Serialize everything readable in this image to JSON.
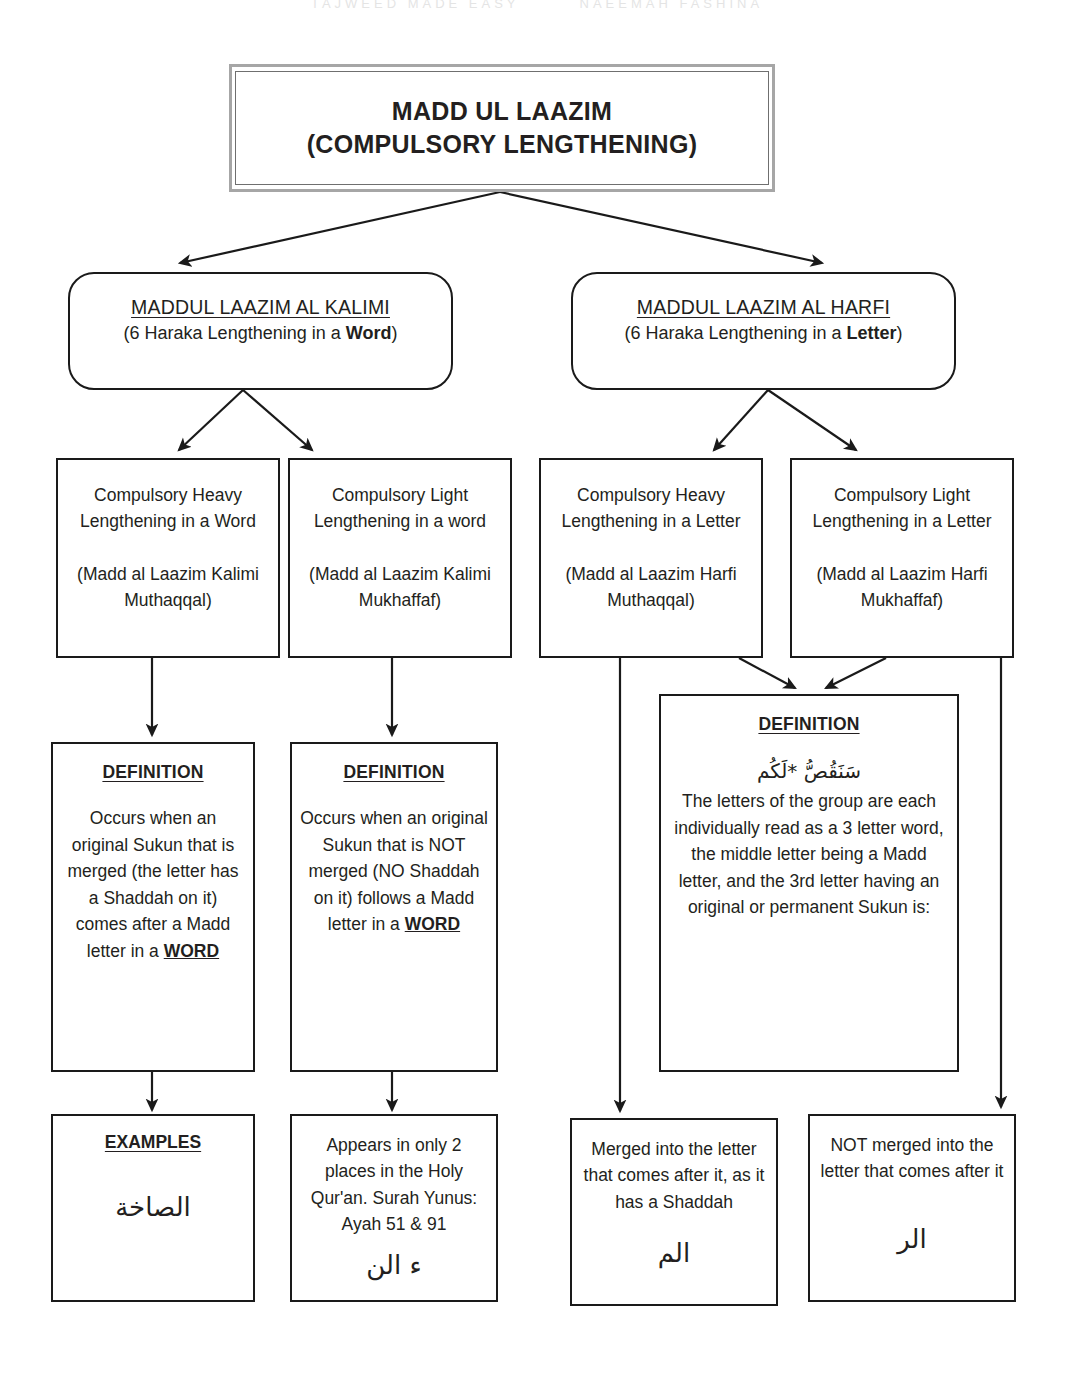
{
  "page_header": {
    "left_text": "TAJWEED MADE EASY",
    "right_text": "NAEEMAH FASHINA"
  },
  "title": {
    "line1": "MADD UL LAAZIM",
    "line2": "(COMPULSORY LENGTHENING)"
  },
  "categories": {
    "kalimi": {
      "title": "MADDUL LAAZIM AL KALIMI",
      "subtitle_pre": "(6 Haraka Lengthening in a ",
      "subtitle_bold": "Word",
      "subtitle_post": ")"
    },
    "harfi": {
      "title": "MADDUL LAAZIM AL HARFI",
      "subtitle_pre": "(6 Haraka Lengthening in a ",
      "subtitle_bold": "Letter",
      "subtitle_post": ")"
    }
  },
  "types": {
    "kalimi_heavy": {
      "description": "Compulsory Heavy Lengthening in a Word",
      "arabic_name": "(Madd al Laazim Kalimi Muthaqqal)"
    },
    "kalimi_light": {
      "description": "Compulsory Light Lengthening in a word",
      "arabic_name": "(Madd al Laazim Kalimi Mukhaffaf)"
    },
    "harfi_heavy": {
      "description": "Compulsory Heavy Lengthening in a Letter",
      "arabic_name": "(Madd al Laazim Harfi Muthaqqal)"
    },
    "harfi_light": {
      "description": "Compulsory Light Lengthening in a Letter",
      "arabic_name": "(Madd al Laazim Harfi Mukhaffaf)"
    }
  },
  "definitions": {
    "kalimi_heavy": {
      "heading": "DEFINITION",
      "text_part1": "Occurs when an original Sukun that is merged (the letter has a Shaddah on it) comes after a Madd letter in a ",
      "emphasis": "WORD"
    },
    "kalimi_light": {
      "heading": "DEFINITION",
      "text_part1": "Occurs when an original Sukun that is NOT merged (NO Shaddah on it) follows a Madd letter in a ",
      "emphasis": "WORD"
    },
    "harfi": {
      "heading": "DEFINITION",
      "arabic": "سَنَقُصُّ *لَكُم",
      "text": "The letters of the group are each individually read as a 3 letter word, the middle letter being a Madd letter, and the 3rd letter having an original or permanent Sukun is:"
    }
  },
  "leaves": {
    "kalimi_heavy_examples": {
      "heading": "EXAMPLES",
      "arabic": "الصاخة"
    },
    "kalimi_light_note": {
      "text": "Appears in only 2 places in the Holy Qur'an. Surah Yunus: Ayah 51 & 91",
      "arabic": "ء الن"
    },
    "harfi_heavy_result": {
      "text": "Merged into the letter that comes after it, as it has a Shaddah",
      "arabic": "الم"
    },
    "harfi_light_result": {
      "text": "NOT merged into the letter that comes after it",
      "arabic": "الر"
    }
  },
  "colors": {
    "title_border_outer": "#a6a6a6",
    "line": "#1a1a1a",
    "text": "#231f20",
    "background": "#ffffff"
  }
}
